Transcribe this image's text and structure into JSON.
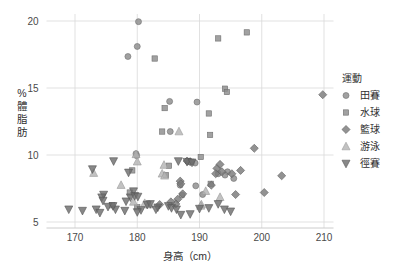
{
  "chart_data": {
    "type": "scatter",
    "title": "",
    "xlabel": "身高（cm）",
    "ylabel": "%體脂肪",
    "ylabel_chars": [
      "%",
      "體",
      "脂",
      "肪"
    ],
    "xlim": [
      165,
      213
    ],
    "ylim": [
      4.3,
      20.6
    ],
    "xticks": [
      170,
      180,
      190,
      200,
      210
    ],
    "xtick_labels": [
      "170",
      "180",
      "190",
      "200",
      "210"
    ],
    "yticks": [
      5,
      10,
      15,
      20
    ],
    "ytick_labels": [
      "5",
      "10",
      "15",
      "20"
    ],
    "grid": true,
    "grid_color": "#d9d9d9",
    "legend": {
      "title": "運動",
      "position": "right",
      "entries": [
        {
          "name": "田賽",
          "marker": "circle",
          "color": "#8c8c8c"
        },
        {
          "name": "水球",
          "marker": "square",
          "color": "#8c8c8c"
        },
        {
          "name": "籃球",
          "marker": "diamond",
          "color": "#7a7a7a"
        },
        {
          "name": "游泳",
          "marker": "triangle-up",
          "color": "#b5b5b5"
        },
        {
          "name": "徑賽",
          "marker": "triangle-down",
          "color": "#6e6e6e"
        }
      ]
    },
    "series": [
      {
        "name": "田賽",
        "marker": "circle",
        "color": "#8c8c8c",
        "points": [
          [
            180.2,
            19.95
          ],
          [
            180.0,
            18.1
          ],
          [
            178.5,
            17.35
          ],
          [
            185.2,
            14.0
          ],
          [
            189.6,
            13.95
          ],
          [
            185.3,
            11.75
          ],
          [
            179.8,
            10.1
          ],
          [
            179.9,
            9.95
          ],
          [
            188.3,
            9.5
          ],
          [
            189.3,
            9.4
          ],
          [
            194.5,
            8.75
          ],
          [
            193.0,
            8.6
          ],
          [
            195.5,
            8.25
          ],
          [
            186.9,
            7.75
          ],
          [
            189.4,
            7.7
          ],
          [
            187.2,
            7.0
          ],
          [
            190.5,
            7.05
          ],
          [
            194.1,
            8.5
          ]
        ]
      },
      {
        "name": "水球",
        "marker": "square",
        "color": "#8c8c8c",
        "points": [
          [
            197.6,
            19.15
          ],
          [
            193.0,
            18.7
          ],
          [
            182.8,
            17.2
          ],
          [
            194.1,
            14.95
          ],
          [
            194.4,
            14.7
          ],
          [
            184.4,
            13.5
          ],
          [
            191.5,
            13.1
          ],
          [
            184.0,
            11.75
          ],
          [
            191.7,
            11.5
          ],
          [
            190.2,
            9.85
          ],
          [
            185.1,
            9.2
          ],
          [
            179.2,
            8.85
          ],
          [
            184.6,
            8.5
          ],
          [
            188.2,
            9.55
          ],
          [
            188.7,
            9.5
          ],
          [
            178.8,
            7.2
          ],
          [
            191.8,
            7.85
          ],
          [
            176.0,
            6.25
          ],
          [
            180.0,
            6.1
          ]
        ]
      },
      {
        "name": "籃球",
        "marker": "diamond",
        "color": "#7a7a7a",
        "points": [
          [
            209.8,
            14.5
          ],
          [
            198.8,
            10.5
          ],
          [
            203.2,
            8.45
          ],
          [
            200.4,
            7.2
          ],
          [
            196.6,
            8.85
          ],
          [
            195.2,
            8.6
          ],
          [
            193.6,
            8.75
          ],
          [
            192.8,
            9.0
          ],
          [
            192.6,
            8.6
          ],
          [
            193.3,
            9.3
          ],
          [
            195.8,
            7.05
          ],
          [
            191.9,
            7.75
          ],
          [
            188.0,
            9.55
          ],
          [
            188.5,
            9.5
          ],
          [
            186.9,
            8.05
          ],
          [
            187.0,
            7.85
          ],
          [
            187.3,
            7.1
          ],
          [
            186.5,
            6.7
          ],
          [
            186.2,
            6.35
          ],
          [
            185.4,
            6.5
          ],
          [
            183.6,
            6.3
          ]
        ]
      },
      {
        "name": "游泳",
        "marker": "triangle-up",
        "color": "#b5b5b5",
        "points": [
          [
            186.7,
            11.75
          ],
          [
            180.0,
            9.5
          ],
          [
            184.3,
            9.25
          ],
          [
            173.0,
            8.65
          ],
          [
            184.0,
            8.6
          ],
          [
            184.4,
            8.45
          ],
          [
            177.4,
            7.75
          ],
          [
            191.0,
            7.3
          ],
          [
            193.3,
            6.85
          ],
          [
            190.3,
            6.3
          ],
          [
            190.2,
            6.2
          ],
          [
            179.4,
            6.5
          ],
          [
            181.2,
            6.4
          ],
          [
            181.9,
            6.3
          ],
          [
            179.8,
            10.05
          ]
        ]
      },
      {
        "name": "徑賽",
        "marker": "triangle-down",
        "color": "#6e6e6e",
        "points": [
          [
            176.2,
            9.55
          ],
          [
            172.8,
            8.95
          ],
          [
            178.6,
            8.7
          ],
          [
            188.0,
            9.5
          ],
          [
            188.8,
            9.45
          ],
          [
            186.6,
            9.55
          ],
          [
            179.4,
            7.3
          ],
          [
            174.6,
            7.05
          ],
          [
            174.3,
            6.85
          ],
          [
            174.5,
            6.6
          ],
          [
            178.9,
            6.85
          ],
          [
            179.6,
            6.95
          ],
          [
            180.1,
            6.9
          ],
          [
            169.0,
            5.95
          ],
          [
            171.2,
            5.85
          ],
          [
            173.4,
            5.95
          ],
          [
            174.0,
            5.7
          ],
          [
            175.3,
            6.15
          ],
          [
            176.5,
            5.95
          ],
          [
            176.1,
            6.2
          ],
          [
            178.2,
            6.55
          ],
          [
            178.0,
            5.85
          ],
          [
            180.6,
            5.9
          ],
          [
            181.6,
            6.3
          ],
          [
            182.1,
            6.35
          ],
          [
            183.3,
            6.1
          ],
          [
            183.0,
            5.95
          ],
          [
            185.0,
            6.2
          ],
          [
            185.5,
            6.05
          ],
          [
            186.3,
            5.95
          ],
          [
            187.0,
            5.55
          ],
          [
            190.0,
            6.0
          ],
          [
            191.5,
            6.05
          ],
          [
            193.0,
            6.35
          ],
          [
            194.0,
            5.95
          ],
          [
            195.0,
            5.8
          ],
          [
            180.0,
            5.75
          ],
          [
            188.5,
            5.6
          ]
        ]
      }
    ]
  }
}
